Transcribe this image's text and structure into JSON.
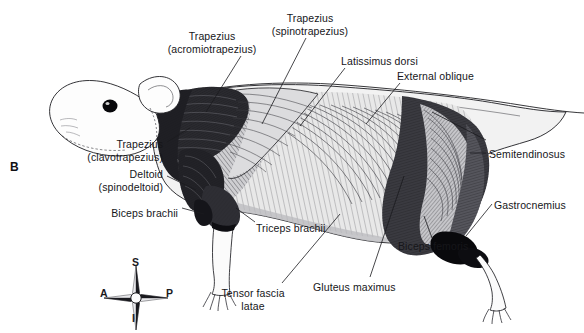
{
  "figure": {
    "panel_letter": "B",
    "background_color": "#ffffff",
    "ink_color": "#16161a"
  },
  "labels": [
    {
      "id": "trapezius-acromiotrapezius",
      "text": "Trapezius\n(acromiotrapezius)",
      "x": 212,
      "y": 30,
      "align": "c"
    },
    {
      "id": "trapezius-spinotrapezius",
      "text": "Trapezius\n(spinotrapezius)",
      "x": 310,
      "y": 12,
      "align": "c"
    },
    {
      "id": "latissimus-dorsi",
      "text": "Latissimus dorsi",
      "x": 341,
      "y": 55,
      "align": "l"
    },
    {
      "id": "external-oblique",
      "text": "External oblique",
      "x": 397,
      "y": 70,
      "align": "l"
    },
    {
      "id": "semitendinosus",
      "text": "Semitendinosus",
      "x": 489,
      "y": 148,
      "align": "l"
    },
    {
      "id": "gastrocnemius",
      "text": "Gastrocnemius",
      "x": 494,
      "y": 199,
      "align": "l"
    },
    {
      "id": "biceps-femoris",
      "text": "Biceps femoris",
      "x": 398,
      "y": 240,
      "align": "l"
    },
    {
      "id": "gluteus-maximus",
      "text": "Gluteus maximus",
      "x": 313,
      "y": 281,
      "align": "l"
    },
    {
      "id": "tensor-fascia-latae",
      "text": "Tensor fascia\nlatae",
      "x": 253,
      "y": 287,
      "align": "c"
    },
    {
      "id": "triceps-brachii",
      "text": "Triceps brachii",
      "x": 256,
      "y": 222,
      "align": "l"
    },
    {
      "id": "biceps-brachii",
      "text": "Biceps brachii",
      "x": 178,
      "y": 207,
      "align": "r"
    },
    {
      "id": "deltoid-spinodeltoid",
      "text": "Deltoid\n(spinodeltoid)",
      "x": 163,
      "y": 168,
      "align": "r"
    },
    {
      "id": "trapezius-clavotrapezius",
      "text": "Trapezius\n(clavotrapezius)",
      "x": 163,
      "y": 138,
      "align": "r"
    }
  ],
  "compass": {
    "label": "anatomical-orientation-compass",
    "center_x": 135,
    "center_y": 297,
    "points": [
      {
        "id": "superior",
        "letter": "S",
        "x": 135,
        "y": 262
      },
      {
        "id": "inferior",
        "letter": "I",
        "x": 135,
        "y": 318
      },
      {
        "id": "anterior",
        "letter": "A",
        "x": 104,
        "y": 292
      },
      {
        "id": "posterior",
        "letter": "P",
        "x": 160,
        "y": 292
      }
    ]
  }
}
